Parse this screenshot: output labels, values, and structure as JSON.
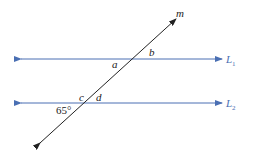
{
  "diagram": {
    "transversal": {
      "label": "m"
    },
    "lines": [
      {
        "name": "L",
        "subscript": "1"
      },
      {
        "name": "L",
        "subscript": "2"
      }
    ],
    "angles": {
      "a": "a",
      "b": "b",
      "c": "c",
      "d": "d",
      "given": "65°"
    },
    "colors": {
      "parallel_lines": "#4a6fb3",
      "transversal": "#222222"
    }
  }
}
